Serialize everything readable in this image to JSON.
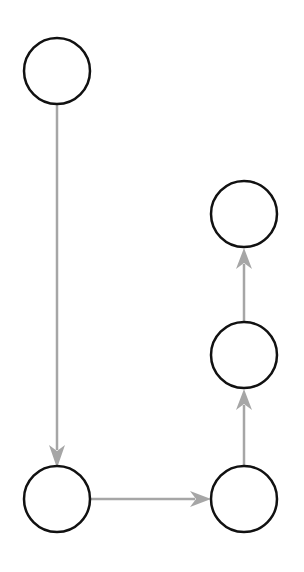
{
  "diagram": {
    "type": "directed-graph",
    "node_stroke": "#111111",
    "edge_color": "#a6a6a6",
    "nodes": [
      {
        "id": "n1",
        "label": "",
        "cx": 57,
        "cy": 71
      },
      {
        "id": "n2",
        "label": "",
        "cx": 57,
        "cy": 499
      },
      {
        "id": "n3",
        "label": "",
        "cx": 244,
        "cy": 499
      },
      {
        "id": "n4",
        "label": "",
        "cx": 244,
        "cy": 355
      },
      {
        "id": "n5",
        "label": "",
        "cx": 244,
        "cy": 214
      }
    ],
    "edges": [
      {
        "from": "n1",
        "to": "n2"
      },
      {
        "from": "n2",
        "to": "n3"
      },
      {
        "from": "n3",
        "to": "n4"
      },
      {
        "from": "n4",
        "to": "n5"
      }
    ]
  }
}
